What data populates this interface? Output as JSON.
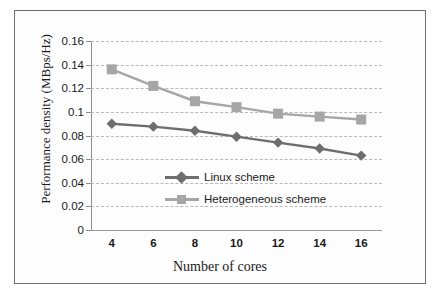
{
  "chart_data": {
    "type": "line",
    "title": "",
    "xlabel": "Number of cores",
    "ylabel": "Performance density (MBps/Hz)",
    "x": [
      4,
      6,
      8,
      10,
      12,
      14,
      16
    ],
    "xticklabels": [
      "4",
      "6",
      "8",
      "10",
      "12",
      "14",
      "16"
    ],
    "xlim": [
      3,
      17
    ],
    "ylim": [
      0,
      0.16
    ],
    "yticks": [
      0,
      0.02,
      0.04,
      0.06,
      0.08,
      0.1,
      0.12,
      0.14,
      0.16
    ],
    "yticklabels": [
      "0",
      "0.02",
      "0.04",
      "0.06",
      "0.08",
      "0.1",
      "0.12",
      "0.14",
      "0.16"
    ],
    "grid": "horizontal-dashed",
    "legend_position": "inside-lower-right",
    "series": [
      {
        "name": "Linux scheme",
        "marker": "diamond",
        "color": "#6e6e6e",
        "values": [
          0.09,
          0.0875,
          0.084,
          0.079,
          0.074,
          0.069,
          0.063
        ]
      },
      {
        "name": "Heterogeneous scheme",
        "marker": "square",
        "color": "#a6a6a6",
        "values": [
          0.136,
          0.122,
          0.109,
          0.104,
          0.0985,
          0.096,
          0.0935
        ]
      }
    ]
  },
  "colors": {
    "series_linux": "#6e6e6e",
    "series_heterogeneous": "#a6a6a6",
    "grid": "#b9b9b9",
    "axis": "#8e8e8e",
    "frame": "#6f6f6f",
    "text": "#1a1a1a",
    "background": "#fdfdfd"
  }
}
